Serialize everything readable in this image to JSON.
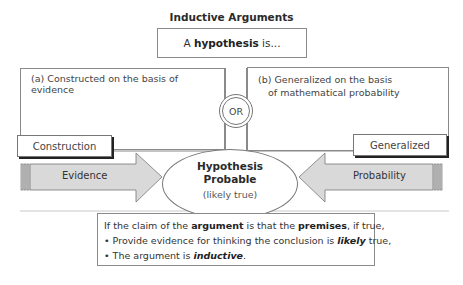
{
  "title": "Inductive Arguments",
  "hypothesis_box": {
    "prefix": "A ",
    "bold": "hypothesis",
    "suffix": " is..."
  },
  "panels": {
    "a": {
      "text": "(a) Constructed on the basis of evidence",
      "label": "Construction"
    },
    "b": {
      "line1": "(b) Generalized on the basis",
      "line2": "of mathematical probability",
      "label": "Generalized"
    }
  },
  "connector": {
    "or_label": "OR"
  },
  "arrows": {
    "left": {
      "label": "Evidence",
      "fill": "#d9d9d9"
    },
    "right": {
      "label": "Probability",
      "fill": "#d9d9d9"
    }
  },
  "center": {
    "line1": "Hypothesis",
    "line2": "Probable",
    "line3": "(likely true)"
  },
  "conclusion": {
    "line1": {
      "a": "If the claim of the ",
      "b": "argument",
      "c": " is that the ",
      "d": "premises",
      "e": ", if true,"
    },
    "line2": {
      "a": "• Provide evidence for thinking the conclusion is ",
      "b": "likely",
      "c": " true,"
    },
    "line3": {
      "a": "• The argument is ",
      "b": "inductive",
      "c": "."
    }
  }
}
